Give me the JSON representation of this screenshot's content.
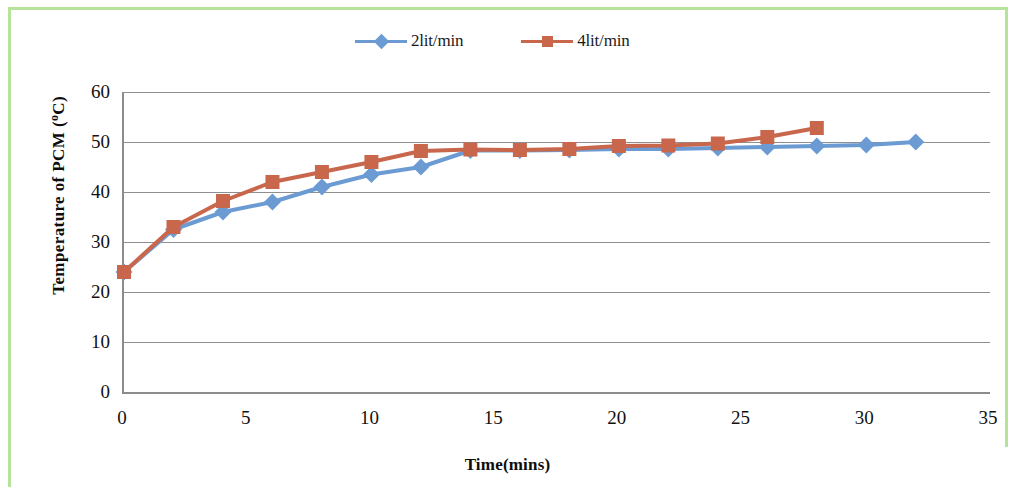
{
  "chart_data": {
    "type": "line",
    "title": "",
    "xlabel": "Time(mins)",
    "ylabel": "Temperature of PCM (ºC)",
    "xlim": [
      0,
      35
    ],
    "ylim": [
      0,
      60
    ],
    "xticks": [
      0,
      5,
      10,
      15,
      20,
      25,
      30,
      35
    ],
    "yticks": [
      0,
      10,
      20,
      30,
      40,
      50,
      60
    ],
    "grid": "horizontal",
    "legend_position": "top-center",
    "series": [
      {
        "name": "2lit/min",
        "color": "#6b9bd2",
        "marker": "diamond",
        "x": [
          0,
          2,
          4,
          6,
          8,
          10,
          12,
          14,
          16,
          18,
          20,
          22,
          24,
          26,
          28,
          30,
          32
        ],
        "values": [
          24,
          32.5,
          36,
          38,
          41,
          43.5,
          45,
          48.3,
          48.3,
          48.4,
          48.6,
          48.6,
          48.8,
          49,
          49.2,
          49.4,
          50
        ]
      },
      {
        "name": "4lit/min",
        "color": "#c9674d",
        "marker": "square",
        "x": [
          0,
          2,
          4,
          6,
          8,
          10,
          12,
          14,
          16,
          18,
          20,
          22,
          24,
          26,
          28
        ],
        "values": [
          24,
          33,
          38.2,
          42,
          44,
          46,
          48.2,
          48.5,
          48.4,
          48.6,
          49.2,
          49.3,
          49.7,
          51,
          52.8
        ]
      }
    ]
  },
  "legend": {
    "items": [
      {
        "label": "2lit/min",
        "color": "#6b9bd2",
        "marker": "diamond"
      },
      {
        "label": "4lit/min",
        "color": "#c9674d",
        "marker": "square"
      }
    ]
  },
  "axis": {
    "y_title_main": "Temperature  of  PCM  (",
    "y_title_deg": "o",
    "y_title_tail": "C)",
    "x_title": "Time(mins)"
  }
}
